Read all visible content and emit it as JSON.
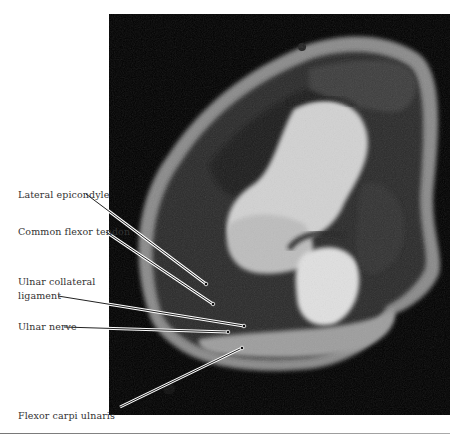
{
  "figure": {
    "type": "axial MRI of elbow",
    "labels": [
      {
        "id": "lateral-epicondyle",
        "text": "Lateral epicondyle"
      },
      {
        "id": "common-flexor-tendon",
        "text": "Common flexor tendon"
      },
      {
        "id": "ulnar-collateral-ligament",
        "line1": "Ulnar collateral",
        "line2": "ligament"
      },
      {
        "id": "ulnar-nerve",
        "text": "Ulnar nerve"
      },
      {
        "id": "flexor-carpi-ulnaris",
        "text": "Flexor carpi ulnaris"
      }
    ]
  }
}
